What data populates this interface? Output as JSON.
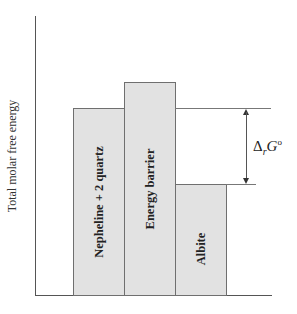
{
  "diagram": {
    "y_axis_label": "Total molar free energy",
    "bars": [
      {
        "label": "Nepheline + 2 quartz",
        "relative_energy": "high"
      },
      {
        "label": "Energy barrier",
        "relative_energy": "highest"
      },
      {
        "label": "Albite",
        "relative_energy": "low"
      }
    ],
    "annotation": {
      "symbol": "Δ",
      "subscript": "r",
      "variable": "G",
      "superscript": "o"
    },
    "colors": {
      "bar_fill": "#e2e2e2",
      "bar_border": "#6f6f6f",
      "axis": "#555555"
    }
  }
}
